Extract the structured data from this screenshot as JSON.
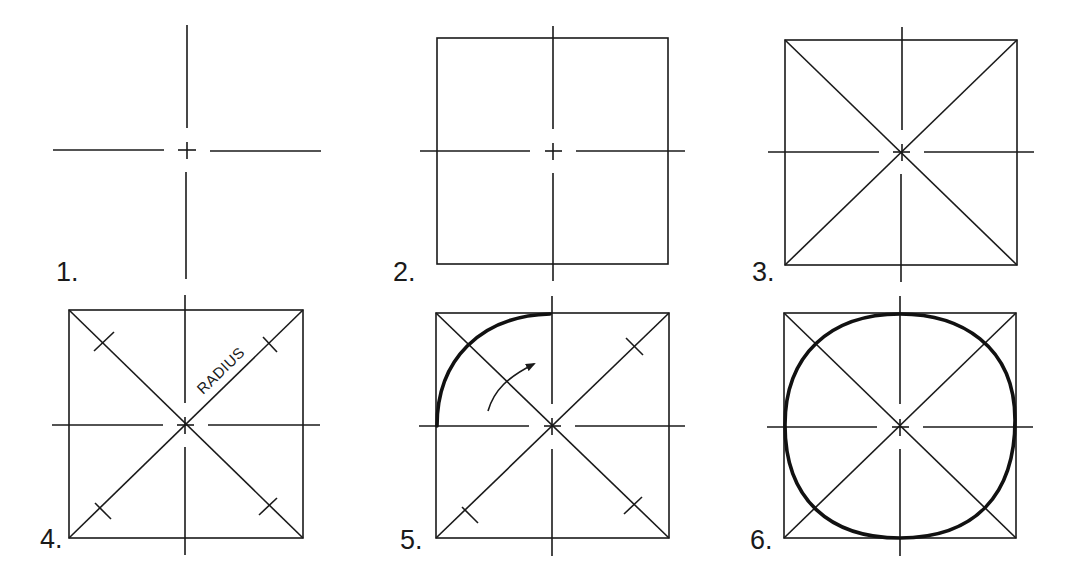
{
  "figure": {
    "line_color": "#1a1a1a",
    "background": "#ffffff",
    "steps": [
      {
        "number": "1.",
        "label": "1.",
        "elements": [
          "centerlines"
        ]
      },
      {
        "number": "2.",
        "label": "2.",
        "elements": [
          "centerlines",
          "enclosing-square"
        ]
      },
      {
        "number": "3.",
        "label": "3.",
        "elements": [
          "centerlines",
          "enclosing-square",
          "diagonals"
        ]
      },
      {
        "number": "4.",
        "label": "4.",
        "elements": [
          "centerlines",
          "enclosing-square",
          "diagonals",
          "radius-marks"
        ],
        "annotation": "RADIUS"
      },
      {
        "number": "5.",
        "label": "5.",
        "elements": [
          "centerlines",
          "enclosing-square",
          "diagonals",
          "radius-marks",
          "first-arc",
          "direction-arrow"
        ]
      },
      {
        "number": "6.",
        "label": "6.",
        "elements": [
          "centerlines",
          "enclosing-square",
          "diagonals",
          "completed-circle"
        ]
      }
    ]
  }
}
